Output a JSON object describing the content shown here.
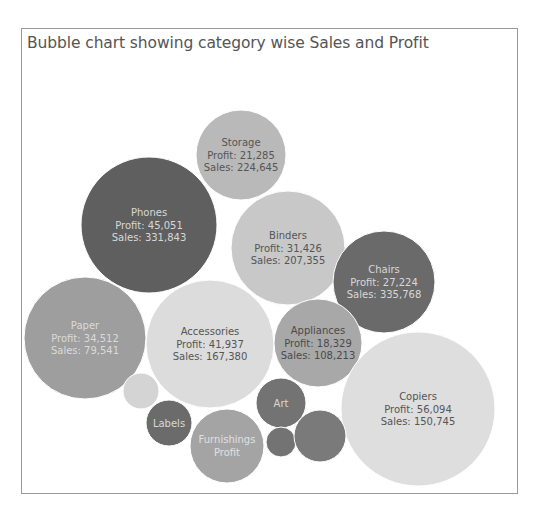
{
  "chart_data": {
    "type": "bubble",
    "title": "Bubble chart showing category wise Sales and Profit",
    "size_measure": "Sales",
    "legend": "none",
    "bubbles": [
      {
        "category": "Storage",
        "profit": 21285,
        "sales": 224645,
        "label_lines": [
          "Storage",
          "Profit: 21,285",
          "Sales: 224,645"
        ],
        "color": "#b9b9b9",
        "text_color": "#555555"
      },
      {
        "category": "Phones",
        "profit": 45051,
        "sales": 331843,
        "label_lines": [
          "Phones",
          "Profit: 45,051",
          "Sales: 331,843"
        ],
        "color": "#5f5f5f",
        "text_color": "#d8d8d8"
      },
      {
        "category": "Binders",
        "profit": 31426,
        "sales": 207355,
        "label_lines": [
          "Binders",
          "Profit: 31,426",
          "Sales: 207,355"
        ],
        "color": "#c8c8c8",
        "text_color": "#555555"
      },
      {
        "category": "Chairs",
        "profit": 27224,
        "sales": 335768,
        "label_lines": [
          "Chairs",
          "Profit: 27,224",
          "Sales: 335,768"
        ],
        "color": "#6a6a6a",
        "text_color": "#d8d8d8"
      },
      {
        "category": "Paper",
        "profit": 34512,
        "sales": 79541,
        "label_lines": [
          "Paper",
          "Profit: 34,512",
          "Sales: 79,541"
        ],
        "color": "#9e9e9e",
        "text_color": "#dadada"
      },
      {
        "category": "Accessories",
        "profit": 41937,
        "sales": 167380,
        "label_lines": [
          "Accessories",
          "Profit: 41,937",
          "Sales: 167,380"
        ],
        "color": "#dcdcdc",
        "text_color": "#555555"
      },
      {
        "category": "Appliances",
        "profit": 18329,
        "sales": 108213,
        "label_lines": [
          "Appliances",
          "Profit: 18,329",
          "Sales: 108,213"
        ],
        "color": "#a8a8a8",
        "text_color": "#4a4a4a"
      },
      {
        "category": "Copiers",
        "profit": 56094,
        "sales": 150745,
        "label_lines": [
          "Copiers",
          "Profit: 56,094",
          "Sales: 150,745"
        ],
        "color": "#dedede",
        "text_color": "#555555"
      },
      {
        "category": "",
        "label_lines": [],
        "color": "#d4d4d4",
        "text_color": "#555555"
      },
      {
        "category": "Labels",
        "label_lines": [
          "Labels"
        ],
        "color": "#6b6b6b",
        "text_color": "#d8d8d8"
      },
      {
        "category": "Furnishings",
        "label_lines": [
          "Furnishings",
          "Profit"
        ],
        "color": "#a4a4a4",
        "text_color": "#e0e0e0"
      },
      {
        "category": "Art",
        "label_lines": [
          "Art"
        ],
        "color": "#737373",
        "text_color": "#d8d8d8"
      },
      {
        "category": "",
        "label_lines": [],
        "color": "#737373",
        "text_color": "#d8d8d8"
      },
      {
        "category": "",
        "label_lines": [],
        "color": "#7a7a7a",
        "text_color": "#d8d8d8"
      }
    ]
  }
}
